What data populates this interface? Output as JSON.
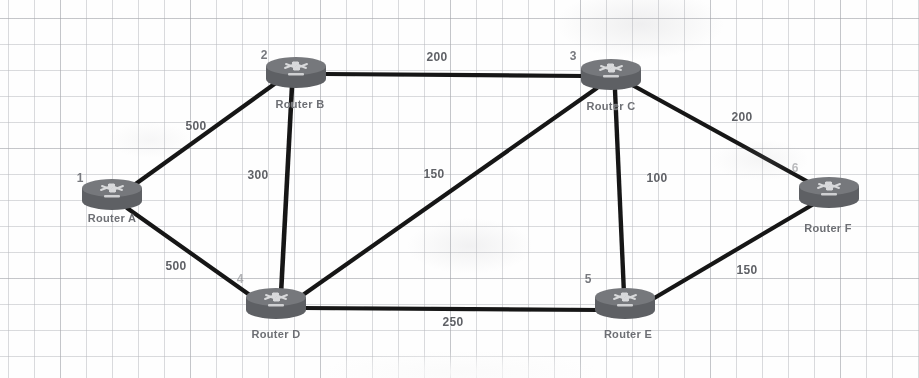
{
  "diagram": {
    "type": "network-graph",
    "background": "graph-paper",
    "ink_color": "#1b1b1b",
    "node_color": "#6a6c70",
    "label_color": "#6d6f74",
    "nodes": [
      {
        "id": "A",
        "number": "1",
        "label": "Router A",
        "x": 112,
        "y": 196,
        "label_x": 112,
        "label_y": 218,
        "num_x": 80,
        "num_y": 178
      },
      {
        "id": "B",
        "number": "2",
        "label": "Router B",
        "x": 296,
        "y": 74,
        "label_x": 300,
        "label_y": 104,
        "num_x": 264,
        "num_y": 55
      },
      {
        "id": "C",
        "number": "3",
        "label": "Router C",
        "x": 611,
        "y": 76,
        "label_x": 611,
        "label_y": 106,
        "num_x": 573,
        "num_y": 56
      },
      {
        "id": "D",
        "number": "4",
        "label": "Router D",
        "x": 276,
        "y": 305,
        "label_x": 276,
        "label_y": 334,
        "num_x": 240,
        "num_y": 279
      },
      {
        "id": "E",
        "number": "5",
        "label": "Router E",
        "x": 625,
        "y": 305,
        "label_x": 628,
        "label_y": 334,
        "num_x": 588,
        "num_y": 279
      },
      {
        "id": "F",
        "number": "6",
        "label": "Router F",
        "x": 829,
        "y": 194,
        "label_x": 828,
        "label_y": 228,
        "num_x": 795,
        "num_y": 168
      }
    ],
    "links": [
      {
        "from": "B",
        "to": "C",
        "weight": "200",
        "label_x": 437,
        "label_y": 57
      },
      {
        "from": "A",
        "to": "B",
        "weight": "500",
        "label_x": 196,
        "label_y": 126
      },
      {
        "from": "B",
        "to": "D",
        "weight": "300",
        "label_x": 258,
        "label_y": 175
      },
      {
        "from": "D",
        "to": "C",
        "weight": "150",
        "label_x": 434,
        "label_y": 174
      },
      {
        "from": "C",
        "to": "E",
        "weight": "100",
        "label_x": 657,
        "label_y": 178
      },
      {
        "from": "C",
        "to": "F",
        "weight": "200",
        "label_x": 742,
        "label_y": 117
      },
      {
        "from": "A",
        "to": "D",
        "weight": "500",
        "label_x": 176,
        "label_y": 266
      },
      {
        "from": "D",
        "to": "E",
        "weight": "250",
        "label_x": 453,
        "label_y": 322
      },
      {
        "from": "E",
        "to": "F",
        "weight": "150",
        "label_x": 747,
        "label_y": 270
      }
    ]
  }
}
